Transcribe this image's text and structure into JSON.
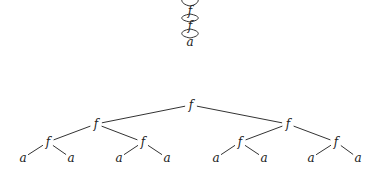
{
  "figure": {
    "dag": {
      "description": "Shared (DAG) representation of the term: chain of f nodes, each with a double edge to the next",
      "center_x": 190,
      "nodes": [
        {
          "id": "d0",
          "label": "f",
          "y": 11
        },
        {
          "id": "d1",
          "label": "f",
          "y": 26
        },
        {
          "id": "d2",
          "label": "a",
          "y": 42
        }
      ],
      "lenses": [
        {
          "from_y": -6,
          "to_y": 6
        },
        {
          "from_y": 14,
          "to_y": 22
        },
        {
          "from_y": 29,
          "to_y": 38
        }
      ]
    },
    "tree": {
      "description": "Full binary tree representation of the same term f(f(f(a,a),f(a,a)),f(f(a,a),f(a,a)))",
      "nodes": [
        {
          "id": "r",
          "label": "f",
          "x": 191,
          "y": 108
        },
        {
          "id": "l",
          "label": "f",
          "x": 96,
          "y": 127
        },
        {
          "id": "rr",
          "label": "f",
          "x": 288,
          "y": 127
        },
        {
          "id": "ll",
          "label": "f",
          "x": 48,
          "y": 145
        },
        {
          "id": "lr",
          "label": "f",
          "x": 143,
          "y": 145
        },
        {
          "id": "rl",
          "label": "f",
          "x": 240,
          "y": 145
        },
        {
          "id": "rrr",
          "label": "f",
          "x": 336,
          "y": 145
        },
        {
          "id": "a1",
          "label": "a",
          "x": 23,
          "y": 161
        },
        {
          "id": "a2",
          "label": "a",
          "x": 71,
          "y": 161
        },
        {
          "id": "a3",
          "label": "a",
          "x": 119,
          "y": 161
        },
        {
          "id": "a4",
          "label": "a",
          "x": 167,
          "y": 161
        },
        {
          "id": "a5",
          "label": "a",
          "x": 216,
          "y": 161
        },
        {
          "id": "a6",
          "label": "a",
          "x": 264,
          "y": 161
        },
        {
          "id": "a7",
          "label": "a",
          "x": 311,
          "y": 161
        },
        {
          "id": "a8",
          "label": "a",
          "x": 358,
          "y": 161
        }
      ],
      "edges": [
        [
          "r",
          "l"
        ],
        [
          "r",
          "rr"
        ],
        [
          "l",
          "ll"
        ],
        [
          "l",
          "lr"
        ],
        [
          "rr",
          "rl"
        ],
        [
          "rr",
          "rrr"
        ],
        [
          "ll",
          "a1"
        ],
        [
          "ll",
          "a2"
        ],
        [
          "lr",
          "a3"
        ],
        [
          "lr",
          "a4"
        ],
        [
          "rl",
          "a5"
        ],
        [
          "rl",
          "a6"
        ],
        [
          "rrr",
          "a7"
        ],
        [
          "rrr",
          "a8"
        ]
      ]
    }
  }
}
